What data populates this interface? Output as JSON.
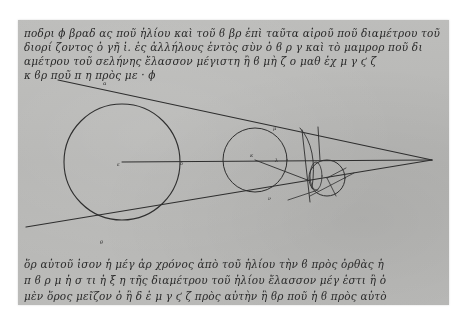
{
  "manuscript": {
    "description": "Photograph of a Greek manuscript page with a geometric diagram of three circles between two converging tangent lines",
    "colors": {
      "background": "#ffffff",
      "parchment": "#b9b9b7",
      "ink": "#2a2a2a"
    },
    "text_top": {
      "lines": [
        "ποδρι ϕ βραδ ας ποῦ ἡλίου καὶ τοῦ ϐ βρ ἐπὶ ταῦτα αἰροῦ ποῦ διαμέτρου τοῦ",
        "διορί ζοντος ὁ γῆ ἱ. ἐς ἀλλήλους ἐντὸς σὺν ὁ ϐ ρ γ καὶ τὸ μαμρορ ποῦ δι",
        "αμέτρου τοῦ σελήνης ἔλασσον μέγιστη ἢ ϐ μὴ ζ ο μαθ ἐχ μ γ ϛ ζ",
        "κ ϐρ ποῦ π η πρὸς με · ϕ"
      ]
    },
    "diagram": {
      "labels": [
        "α",
        "ε",
        "κ",
        "δ",
        "θ",
        "λ",
        "μ",
        "ν"
      ],
      "large_circle": {
        "cx": 104,
        "cy": 142,
        "r": 58
      },
      "medium_circle": {
        "cx": 237,
        "cy": 140,
        "r": 32
      },
      "small_circle": {
        "cx": 309,
        "cy": 158,
        "r": 18
      },
      "apex": {
        "x": 414,
        "y": 140
      }
    },
    "text_bottom": {
      "lines": [
        "ὅρ αὐτοῦ ἰσον ἡ μέγ ἀρ χρόνος ἀπὸ τοῦ ἡλίου τὴν ϐ πρὸς ὀρθὰς ἡ",
        "π ϐ ρ μ ἡ σ τι ἡ ξ η τῆς διαμέτρου τοῦ ἡλίου ἔλασσον μέγ ἐστι ἢ ὁ",
        "μὲν ὅρος μεῖζον ὁ ἢ δ ἐ μ γ ϛ ζ πρὸς αὐτὴν ἢ ϐρ ποῦ ἡ ϐ πρὸς αὐτὸ"
      ]
    }
  }
}
